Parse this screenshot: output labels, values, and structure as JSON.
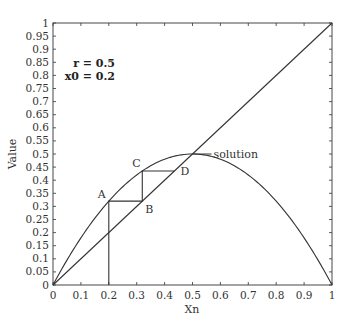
{
  "chart_data": {
    "type": "line",
    "title": "",
    "xlabel": "Xn",
    "ylabel": "Value",
    "xlim": [
      0,
      1
    ],
    "ylim": [
      0,
      1
    ],
    "grid": false,
    "x_ticks": [
      "0",
      "0.1",
      "0.2",
      "0.3",
      "0.4",
      "0.5",
      "0.6",
      "0.7",
      "0.8",
      "0.9",
      "1"
    ],
    "y_ticks": [
      "0",
      "0.05",
      "0.1",
      "0.15",
      "0.2",
      "0.25",
      "0.3",
      "0.35",
      "0.4",
      "0.45",
      "0.5",
      "0.55",
      "0.6",
      "0.65",
      "0.7",
      "0.75",
      "0.8",
      "0.85",
      "0.9",
      "0.95",
      "1"
    ],
    "annotation_lines": [
      "r = 0.5",
      "x0 = 0.2"
    ],
    "series": [
      {
        "name": "map curve",
        "x": [
          0,
          0.1,
          0.2,
          0.3,
          0.4,
          0.5,
          0.6,
          0.7,
          0.8,
          0.9,
          1
        ],
        "values": [
          0,
          0.18,
          0.32,
          0.42,
          0.48,
          0.5,
          0.48,
          0.42,
          0.32,
          0.18,
          0
        ]
      },
      {
        "name": "identity line y = x",
        "x": [
          0,
          1
        ],
        "values": [
          0,
          1
        ]
      },
      {
        "name": "cobweb iteration",
        "x": [
          0.2,
          0.2,
          0.32,
          0.32,
          0.4352
        ],
        "values": [
          0,
          0.32,
          0.32,
          0.4352,
          0.4352
        ]
      }
    ],
    "points": [
      {
        "label": "A",
        "x": 0.2,
        "y": 0.32
      },
      {
        "label": "B",
        "x": 0.32,
        "y": 0.32
      },
      {
        "label": "C",
        "x": 0.32,
        "y": 0.4352
      },
      {
        "label": "D",
        "x": 0.4352,
        "y": 0.4352
      }
    ],
    "callout": {
      "label": "solution",
      "x": 0.5,
      "y": 0.5
    }
  }
}
